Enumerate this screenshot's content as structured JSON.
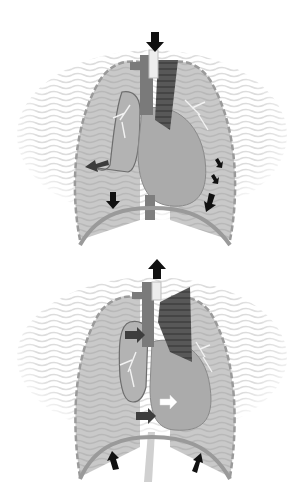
{
  "diagram": {
    "type": "anatomical-illustration",
    "colors": {
      "background": "#ffffff",
      "lung_fill": "#c8c8c8",
      "wave_texture": "#e2e2e2",
      "heart_fill": "#a9a9a9",
      "vessel_dark": "#5f5f5f",
      "vessel_mid": "#808080",
      "diaphragm": "#9a9a9a",
      "arrow_black": "#111111",
      "arrow_dark": "#3d3d3d",
      "arrow_white": "#ffffff"
    },
    "panels": [
      {
        "id": "top",
        "phase": "inspiration",
        "arrows": [
          {
            "position": "trachea-top",
            "direction": "down",
            "color": "black",
            "size": "large"
          },
          {
            "position": "right-lung-lower-left",
            "direction": "down-left",
            "color": "dark-gray",
            "size": "medium"
          },
          {
            "position": "right-diaphragm",
            "direction": "down",
            "color": "black",
            "size": "medium"
          },
          {
            "position": "left-lung-lateral-1",
            "direction": "down-right",
            "color": "black",
            "size": "small"
          },
          {
            "position": "left-lung-lateral-2",
            "direction": "down-right",
            "color": "black",
            "size": "small"
          },
          {
            "position": "left-diaphragm",
            "direction": "down-left",
            "color": "black",
            "size": "medium"
          }
        ]
      },
      {
        "id": "bottom",
        "phase": "expiration",
        "arrows": [
          {
            "position": "trachea-top",
            "direction": "up",
            "color": "black",
            "size": "large"
          },
          {
            "position": "right-atrium",
            "direction": "right",
            "color": "dark-gray",
            "size": "medium"
          },
          {
            "position": "inferior-vena-cava",
            "direction": "right",
            "color": "dark-gray",
            "size": "medium"
          },
          {
            "position": "left-ventricle",
            "direction": "right",
            "color": "white",
            "size": "medium"
          },
          {
            "position": "right-diaphragm",
            "direction": "up",
            "color": "black",
            "size": "medium"
          },
          {
            "position": "left-diaphragm",
            "direction": "up-right",
            "color": "black",
            "size": "medium"
          }
        ]
      }
    ]
  }
}
